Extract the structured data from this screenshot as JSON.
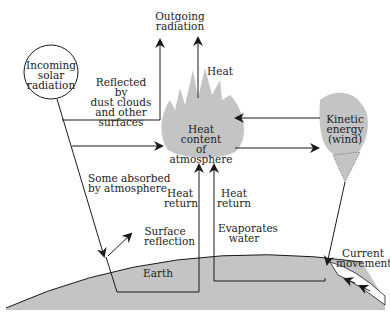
{
  "diagram": {
    "type": "energy-flow",
    "colors": {
      "line": "#1a1a1a",
      "fill_gray": "#c4c4c4",
      "background": "#ffffff",
      "text": "#222222"
    },
    "nodes": {
      "incoming_solar": "Incoming\nsolar\nradiation",
      "outgoing_radiation": "Outgoing\nradiation",
      "heat_content": "Heat content\nof\natmosphere",
      "kinetic_energy": "Kinetic\nenergy\n(wind)",
      "earth": "Earth"
    },
    "labels": {
      "reflected": "Reflected by\ndust clouds\nand other\nsurfaces",
      "heat": "Heat",
      "some_absorbed": "Some absorbed\nby atmosphere",
      "heat_return_1": "Heat\nreturn",
      "heat_return_2": "Heat\nreturn",
      "surface_reflection": "Surface\nreflection",
      "evaporates_water": "Evaporates\nwater",
      "current_movement": "Current\nmovement"
    }
  }
}
